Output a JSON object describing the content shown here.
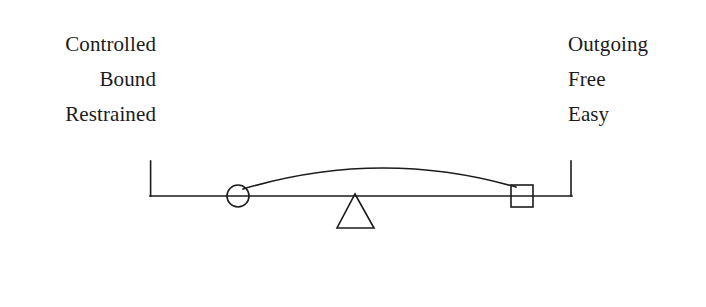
{
  "page": {
    "background_color": "#ffffff",
    "ink_color": "#1b1b1b",
    "width": 706,
    "height": 307
  },
  "left_labels": {
    "align": "right",
    "items": [
      {
        "text": "Controlled"
      },
      {
        "text": "Bound"
      },
      {
        "text": "Restrained"
      }
    ]
  },
  "right_labels": {
    "align": "left",
    "items": [
      {
        "text": "Outgoing"
      },
      {
        "text": "Free"
      },
      {
        "text": "Easy"
      }
    ]
  },
  "diagram": {
    "type": "balance-seesaw",
    "stroke_color": "#1b1b1b",
    "stroke_width": 1.6,
    "beam": {
      "x1": 150,
      "x2": 572,
      "y": 56
    },
    "left_end_tick": {
      "x": 150,
      "y_top": 21,
      "y_bottom": 56
    },
    "right_end_tick": {
      "x": 571,
      "y_top": 21,
      "y_bottom": 56
    },
    "fulcrum_triangle": {
      "apex_x": 355,
      "apex_y": 54,
      "base_left_x": 337,
      "base_right_x": 374,
      "base_y": 88
    },
    "circle_marker": {
      "cx": 238,
      "cy": 56,
      "r": 11
    },
    "square_marker": {
      "x": 511,
      "y": 45,
      "size": 22
    },
    "arc": {
      "start_x": 243,
      "start_y": 49,
      "end_x": 516,
      "end_y": 47,
      "peak_y": 16
    }
  }
}
